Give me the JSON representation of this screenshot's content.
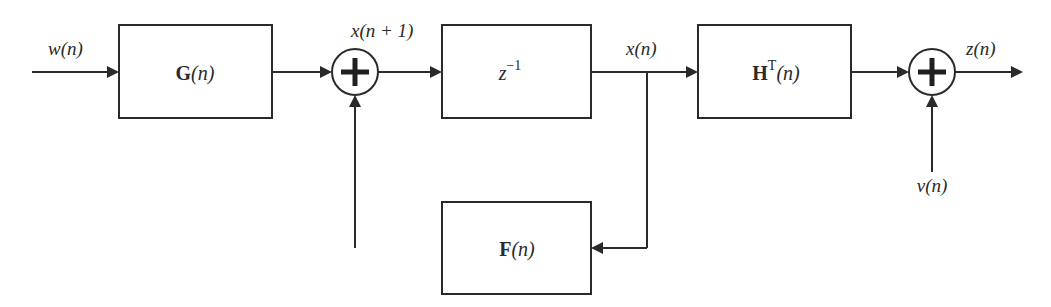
{
  "diagram": {
    "type": "block-diagram",
    "signals": {
      "input": "w(n)",
      "state_next": "x(n + 1)",
      "state": "x(n)",
      "measurement_noise": "v(n)",
      "output": "z(n)"
    },
    "blocks": {
      "g": {
        "bold": "G",
        "rest": "(n)"
      },
      "delay": {
        "base": "z",
        "sup": "−1"
      },
      "h": {
        "bold": "H",
        "sup": "T",
        "rest": "(n)"
      },
      "f": {
        "bold": "F",
        "rest": "(n)"
      }
    },
    "summers": [
      {
        "id": "sum-state",
        "symbol": "+"
      },
      {
        "id": "sum-output",
        "symbol": "+"
      }
    ],
    "connections": [
      {
        "from": "w(n)",
        "to": "G(n)"
      },
      {
        "from": "G(n)",
        "to": "sum-state"
      },
      {
        "from": "sum-state",
        "to": "z^-1",
        "label": "x(n + 1)"
      },
      {
        "from": "z^-1",
        "to": "H^T(n)",
        "label": "x(n)"
      },
      {
        "from": "x(n)",
        "to": "F(n)"
      },
      {
        "from": "F(n)",
        "to": "sum-state"
      },
      {
        "from": "H^T(n)",
        "to": "sum-output"
      },
      {
        "from": "v(n)",
        "to": "sum-output"
      },
      {
        "from": "sum-output",
        "to": "output",
        "label": "z(n)"
      }
    ]
  }
}
